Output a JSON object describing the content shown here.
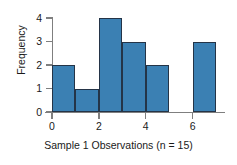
{
  "chart_data": {
    "type": "bar",
    "title": "",
    "xlabel": "Sample 1 Observations (n = 15)",
    "ylabel": "Frequency",
    "categories": [
      "0-1",
      "1-2",
      "2-3",
      "3-4",
      "4-5",
      "5-6",
      "6-7"
    ],
    "bin_edges": [
      0,
      1,
      2,
      3,
      4,
      5,
      6,
      7
    ],
    "values": [
      2,
      1,
      4,
      3,
      2,
      0,
      3
    ],
    "total_count": 15,
    "xlim": [
      0,
      7
    ],
    "ylim": [
      0,
      4
    ],
    "xticks": [
      0,
      2,
      4,
      6
    ],
    "xtick_labels": [
      "0",
      "2",
      "4",
      "6"
    ],
    "yticks": [
      0,
      1,
      2,
      3,
      4
    ],
    "ytick_labels": [
      "0",
      "1",
      "2",
      "3",
      "4"
    ],
    "grid": false,
    "legend": false,
    "bar_color": "#3b80b3",
    "bar_edge_color": "#243447",
    "axis_color": "#7f7f7f",
    "background_color": "#ffffff"
  }
}
